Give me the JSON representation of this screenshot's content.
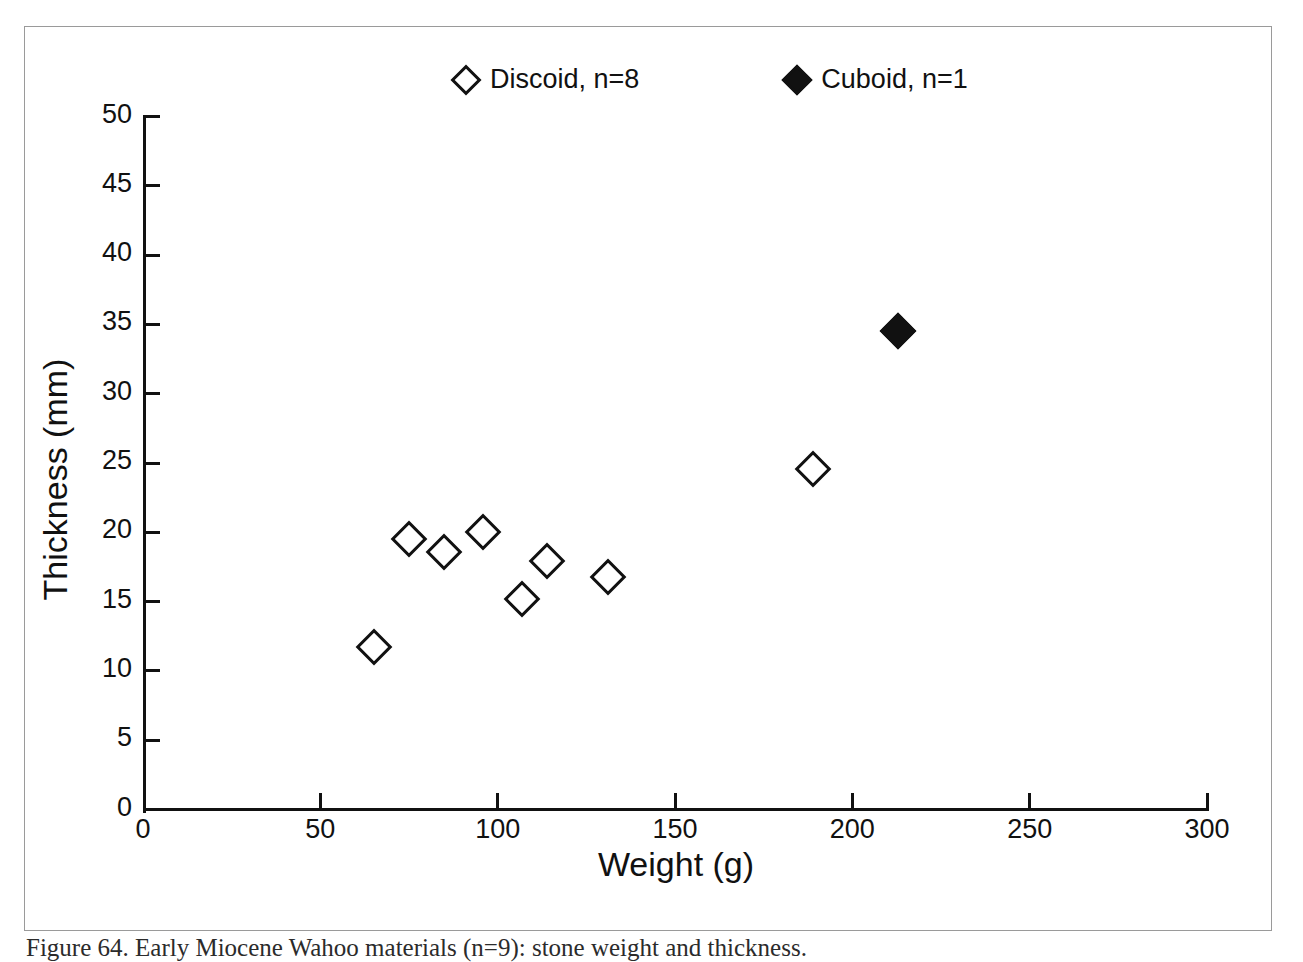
{
  "figure": {
    "caption": "Figure 64. Early Miocene Wahoo materials (n=9): stone weight and thickness."
  },
  "legend": {
    "position": "top-center",
    "entries": [
      {
        "label": "Discoid, n=8",
        "marker": "open-diamond-icon",
        "fill": "#ffffff",
        "stroke": "#111111"
      },
      {
        "label": "Cuboid, n=1",
        "marker": "filled-diamond-icon",
        "fill": "#111111",
        "stroke": "#111111"
      }
    ]
  },
  "chart_data": {
    "type": "scatter",
    "title": "",
    "xlabel": "Weight (g)",
    "ylabel": "Thickness (mm)",
    "xlim": [
      0,
      300
    ],
    "ylim": [
      0,
      50
    ],
    "xticks": [
      0,
      50,
      100,
      150,
      200,
      250,
      300
    ],
    "yticks": [
      0,
      5,
      10,
      15,
      20,
      25,
      30,
      35,
      40,
      45,
      50
    ],
    "grid": false,
    "legend_position": "top-center",
    "series": [
      {
        "name": "Discoid, n=8",
        "marker": "open-diamond",
        "n": 8,
        "points": [
          {
            "x": 65,
            "y": 11.7
          },
          {
            "x": 75,
            "y": 19.5
          },
          {
            "x": 85,
            "y": 18.6
          },
          {
            "x": 96,
            "y": 20.0
          },
          {
            "x": 107,
            "y": 15.2
          },
          {
            "x": 114,
            "y": 17.9
          },
          {
            "x": 131,
            "y": 16.8
          },
          {
            "x": 189,
            "y": 24.6
          }
        ]
      },
      {
        "name": "Cuboid, n=1",
        "marker": "filled-diamond",
        "n": 1,
        "points": [
          {
            "x": 213,
            "y": 34.5
          }
        ]
      }
    ]
  },
  "axis": {
    "x_tick_labels": [
      "0",
      "50",
      "100",
      "150",
      "200",
      "250",
      "300"
    ],
    "y_tick_labels": [
      "0",
      "5",
      "10",
      "15",
      "20",
      "25",
      "30",
      "35",
      "40",
      "45",
      "50"
    ]
  },
  "colors": {
    "ink": "#111111",
    "frame": "#9a9a9a",
    "background": "#ffffff"
  }
}
